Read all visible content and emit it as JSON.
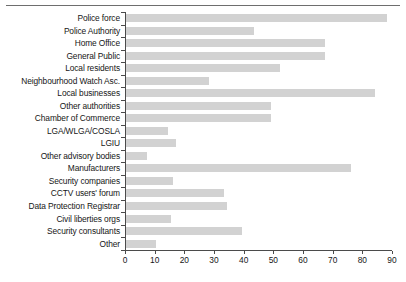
{
  "figure": {
    "has_top_rule": true,
    "bar_color": "#d2d2d2",
    "axis_color": "#4b4b4b",
    "text_color": "#161616"
  },
  "chart_data": {
    "type": "bar",
    "orientation": "horizontal",
    "title": "",
    "subtitle": "",
    "xlabel": "",
    "ylabel": "",
    "xlim": [
      0,
      90
    ],
    "xticks": [
      0,
      10,
      20,
      30,
      40,
      50,
      60,
      70,
      80,
      90
    ],
    "xtick_labels": [
      "0",
      "10",
      "20",
      "30",
      "40",
      "50",
      "60",
      "70",
      "80",
      "90"
    ],
    "grid": false,
    "legend": false,
    "categories": [
      "Police force",
      "Police Authority",
      "Home Office",
      "General Public",
      "Local residents",
      "Neighbourhood Watch Asc.",
      "Local businesses",
      "Other authorities",
      "Chamber of Commerce",
      "LGA/WLGA/COSLA",
      "LGIU",
      "Other advisory bodies",
      "Manufacturers",
      "Security companies",
      "CCTV users' forum",
      "Data Protection Registrar",
      "Civil liberties orgs",
      "Security consultants",
      "Other"
    ],
    "values": [
      88,
      43,
      67,
      67,
      52,
      28,
      84,
      49,
      49,
      14,
      17,
      7,
      76,
      16,
      33,
      34,
      15,
      39,
      10
    ]
  }
}
